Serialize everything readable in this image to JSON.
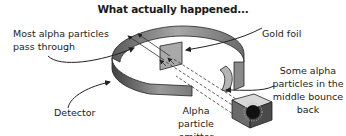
{
  "title": "What actually happened...",
  "labels": {
    "pass_through_line1": "Most alpha particles",
    "pass_through_line2": "pass through",
    "gold_foil": "Gold foil",
    "bounce_line1": "Some alpha",
    "bounce_line2": "particles in the",
    "bounce_line3": "middle bounce",
    "bounce_line4": "back",
    "detector": "Detector",
    "emitter_line1": "Alpha particle",
    "emitter_line2": "emitter"
  },
  "components": [
    "detector-ring",
    "gold-foil",
    "alpha-particle-emitter",
    "alpha-particle-paths"
  ]
}
